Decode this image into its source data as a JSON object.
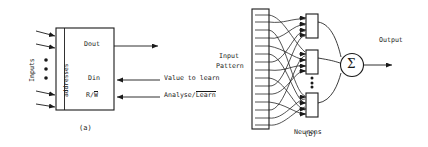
{
  "figure": {
    "panel_a": {
      "caption": "(a)",
      "inputs_label": "Inputs",
      "addresses_label": "addresses",
      "dout_label": "Dout",
      "din_label": "Din",
      "rw_label_prefix": "R/",
      "rw_label_overline": "W",
      "value_to_learn_label": "Value to learn",
      "analyse_prefix": "Analyse/",
      "analyse_overline": "Learn",
      "input_arrow_count": 4,
      "vertical_dots": 3
    },
    "panel_b": {
      "caption": "(b)",
      "input_pattern_line1": "Input",
      "input_pattern_line2": "Pattern",
      "neurons_label": "Neurons",
      "output_label": "Output",
      "sum_symbol": "Σ",
      "neuron_box_count": 3,
      "vertical_dots": 4
    },
    "colors": {
      "ink": "#1a1a1a",
      "background": "#ffffff"
    }
  }
}
